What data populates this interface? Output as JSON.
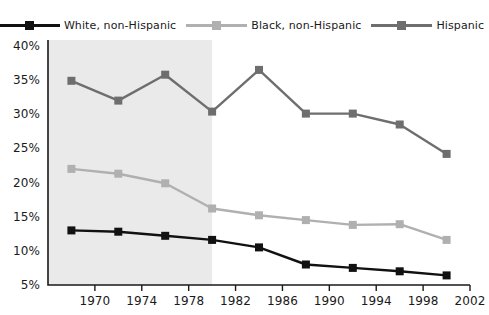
{
  "chart_data": {
    "type": "line",
    "title": "",
    "xlabel": "",
    "ylabel": "",
    "xlim": [
      1966,
      2002
    ],
    "ylim": [
      5,
      40
    ],
    "grid": false,
    "legend_position": "top",
    "x": [
      1968,
      1972,
      1976,
      1980,
      1984,
      1988,
      1992,
      1996,
      2000
    ],
    "xticks": [
      1970,
      1974,
      1978,
      1982,
      1986,
      1990,
      1994,
      1998,
      2002
    ],
    "xticklabels": [
      "1970",
      "1974",
      "1978",
      "1982",
      "1986",
      "1990",
      "1994",
      "1998",
      "2002"
    ],
    "yticks": [
      5,
      10,
      15,
      20,
      25,
      30,
      35,
      40
    ],
    "yticklabels": [
      "5%",
      "10%",
      "15%",
      "20%",
      "25%",
      "30%",
      "35%",
      "40%"
    ],
    "shaded_region": {
      "x_start": 1966,
      "x_end": 1980,
      "color": "#eaeaea"
    },
    "series": [
      {
        "name": "White, non-Hispanic",
        "color": "#111111",
        "values": [
          13.0,
          12.8,
          12.2,
          11.6,
          10.5,
          8.0,
          7.5,
          7.0,
          6.4
        ]
      },
      {
        "name": "Black, non-Hispanic",
        "color": "#b0b0b0",
        "values": [
          22.0,
          21.3,
          19.9,
          16.2,
          15.2,
          14.5,
          13.8,
          13.9,
          11.6
        ]
      },
      {
        "name": "Hispanic",
        "color": "#6e6e6e",
        "values": [
          34.9,
          32.0,
          35.8,
          30.4,
          36.5,
          30.1,
          30.1,
          28.5,
          24.2
        ]
      }
    ]
  },
  "legend": {
    "items": [
      {
        "label": "White, non-Hispanic",
        "color": "#111111"
      },
      {
        "label": "Black, non-Hispanic",
        "color": "#b0b0b0"
      },
      {
        "label": "Hispanic",
        "color": "#6e6e6e"
      }
    ]
  },
  "axis": {
    "line_color": "#1a1a1a"
  }
}
